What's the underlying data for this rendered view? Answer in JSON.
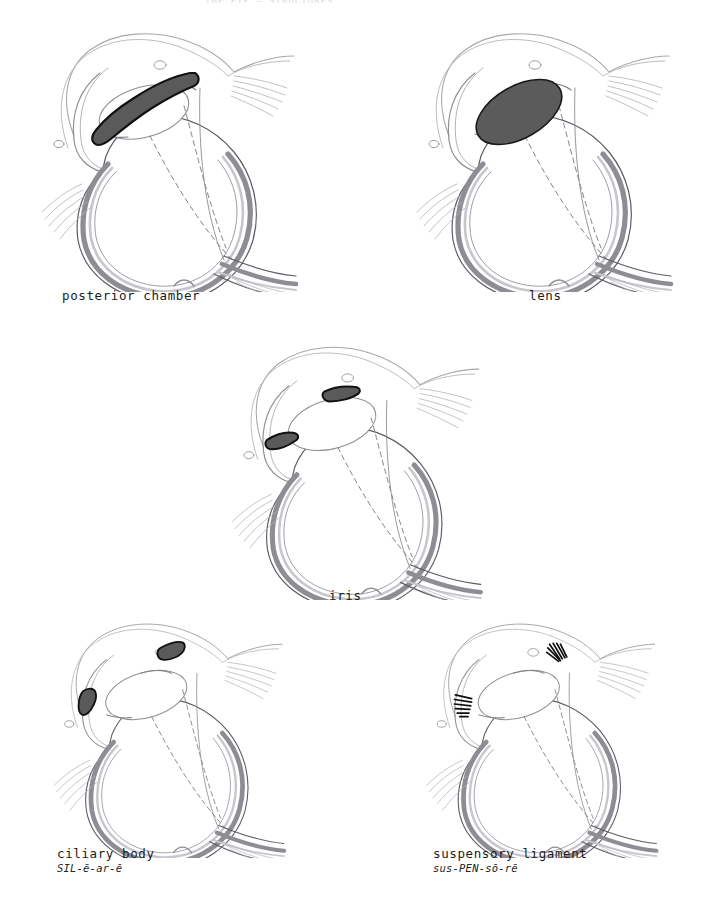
{
  "document": {
    "header_fragment": "THE EYE  —  STRUCTURES",
    "page_background": "#ffffff"
  },
  "palette": {
    "outline": "#1b1b1b",
    "sclera_line": "#9a9aa2",
    "choroid_gray": "#8d8d93",
    "retina_gray": "#b9b9bf",
    "highlight_fill": "#5a5a5a",
    "highlight_stroke": "#111111",
    "lens_fill": "#5b5b5b",
    "text": "#1b1b1b",
    "muscle_gray": "#a9a9b0"
  },
  "panels": [
    {
      "id": "posterior-chamber",
      "term": "posterior chamber",
      "pronunciation": "",
      "highlight": "crescent-band-behind-iris",
      "position": "top-left"
    },
    {
      "id": "lens",
      "term": "lens",
      "pronunciation": "",
      "highlight": "filled-ellipse",
      "position": "top-right"
    },
    {
      "id": "iris",
      "term": "iris",
      "pronunciation": "",
      "highlight": "two-small-blades",
      "position": "middle-center"
    },
    {
      "id": "ciliary-body",
      "term": "ciliary body",
      "pronunciation": "SIL-ē-ar-ē",
      "highlight": "two-wedge-blocks",
      "position": "bottom-left"
    },
    {
      "id": "suspensory-ligament",
      "term": "suspensory ligament",
      "pronunciation": "sus-PEN-sō-rē",
      "highlight": "two-hatched-fans",
      "position": "bottom-right"
    }
  ]
}
